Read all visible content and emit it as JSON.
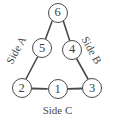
{
  "figure": {
    "stroke_color": "#4a4a4a",
    "text_color": "#3d3d3d",
    "background_color": "#ffffff"
  },
  "nodes": [
    {
      "id": "node-6",
      "label": "6",
      "cx": 57.5,
      "cy": 12.5
    },
    {
      "id": "node-5",
      "label": "5",
      "cx": 42.0,
      "cy": 48.0
    },
    {
      "id": "node-4",
      "label": "4",
      "cx": 72.0,
      "cy": 49.5
    },
    {
      "id": "node-2",
      "label": "2",
      "cx": 21.5,
      "cy": 88.0
    },
    {
      "id": "node-1",
      "label": "1",
      "cx": 57.5,
      "cy": 89.0
    },
    {
      "id": "node-3",
      "label": "3",
      "cx": 92.0,
      "cy": 88.0
    }
  ],
  "edges": [
    {
      "id": "edge-6-5",
      "from": "6",
      "to": "5",
      "x1": 52.0,
      "y1": 21.5,
      "x2": 45.5,
      "y2": 39.0
    },
    {
      "id": "edge-6-4",
      "from": "6",
      "to": "4",
      "x1": 63.5,
      "y1": 21.5,
      "x2": 69.5,
      "y2": 40.0
    },
    {
      "id": "edge-5-2",
      "from": "5",
      "to": "2",
      "x1": 37.5,
      "y1": 57.0,
      "x2": 26.0,
      "y2": 79.0
    },
    {
      "id": "edge-4-3",
      "from": "4",
      "to": "3",
      "x1": 76.5,
      "y1": 58.5,
      "x2": 88.0,
      "y2": 79.0
    },
    {
      "id": "edge-2-1",
      "from": "2",
      "to": "1",
      "x1": 32.0,
      "y1": 88.5,
      "x2": 47.0,
      "y2": 88.8
    },
    {
      "id": "edge-1-3",
      "from": "1",
      "to": "3",
      "x1": 68.0,
      "y1": 88.8,
      "x2": 82.0,
      "y2": 88.5
    }
  ],
  "side_labels": {
    "side_a": "Side A",
    "side_b": "Side B",
    "side_c": "Side C"
  }
}
